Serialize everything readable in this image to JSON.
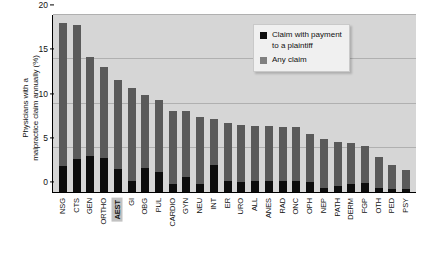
{
  "chart_data": {
    "type": "bar",
    "subtype": "stacked",
    "title": "",
    "xlabel": "",
    "ylabel": "Physicians with a malpractice claim annually (%)",
    "ylabel_lines": [
      "Physicians with a",
      "malpractice claim annually (%)"
    ],
    "ylim": [
      0,
      20
    ],
    "yticks": [
      0,
      5,
      10,
      15,
      20
    ],
    "ytick_labels": [
      "0",
      "5",
      "10",
      "15",
      "20"
    ],
    "grid": true,
    "grid_axis": "y",
    "legend_position": "top-right",
    "highlight_category": "AEST",
    "categories": [
      "NSG",
      "CTS",
      "GEN",
      "ORTHO",
      "AEST",
      "GI",
      "OBG",
      "PUL",
      "CARDIO",
      "GYN",
      "NEU",
      "INT",
      "ER",
      "URO",
      "ALL",
      "ANES",
      "RAD",
      "ONC",
      "OPH",
      "NEP",
      "PATH",
      "DERM",
      "FGP",
      "OTH",
      "PED",
      "PSY"
    ],
    "series": [
      {
        "name": "Any claim",
        "color": "#5a5a5a",
        "values": [
          19.1,
          18.9,
          15.3,
          14.1,
          12.7,
          11.7,
          11.0,
          10.4,
          9.2,
          9.1,
          8.5,
          8.2,
          7.8,
          7.6,
          7.5,
          7.5,
          7.3,
          7.3,
          6.5,
          6.0,
          5.6,
          5.5,
          5.2,
          4.0,
          3.1,
          2.5
        ]
      },
      {
        "name": "Claim with payment to a plaintiff",
        "color": "#0d0d0d",
        "values": [
          2.9,
          3.7,
          4.1,
          3.8,
          2.6,
          1.2,
          2.7,
          2.3,
          0.9,
          1.7,
          0.9,
          3.0,
          1.2,
          1.1,
          1.3,
          1.3,
          1.2,
          1.3,
          1.1,
          0.4,
          0.7,
          0.9,
          1.0,
          0.5,
          0.3,
          0.3
        ]
      }
    ],
    "legend": [
      {
        "label_lines": [
          "Claim with payment",
          "to a plaintiff"
        ],
        "swatch": "black"
      },
      {
        "label_lines": [
          "Any claim"
        ],
        "swatch": "gray"
      }
    ]
  },
  "colors": {
    "plot_background": "#d6d6d6",
    "gridline": "#b0b0b0",
    "axis": "#000000",
    "any_claim": "#5a5a5a",
    "paid_claim": "#0d0d0d",
    "legend_background": "#f0f0f0",
    "highlight_background": "#c2c2c2"
  }
}
